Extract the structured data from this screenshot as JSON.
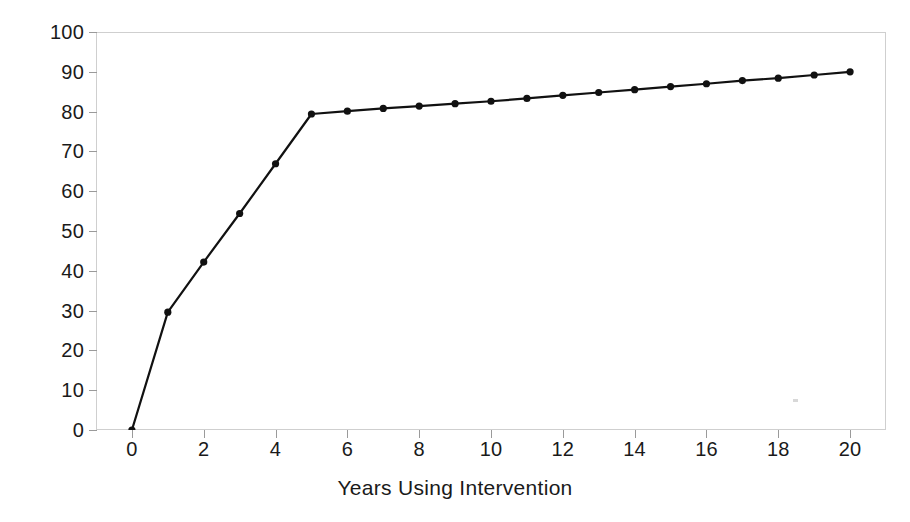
{
  "chart_data": {
    "type": "line",
    "title": "",
    "xlabel": "Years Using Intervention",
    "ylabel": "Percent Mortality Averted",
    "xlim": [
      -1,
      21
    ],
    "ylim": [
      0,
      100
    ],
    "grid": false,
    "legend": false,
    "line_color": "#111111",
    "marker": "circle",
    "marker_color": "#111111",
    "x": [
      0,
      1,
      2,
      3,
      4,
      5,
      6,
      7,
      8,
      9,
      10,
      11,
      12,
      13,
      14,
      15,
      16,
      17,
      18,
      19,
      20
    ],
    "values": [
      0,
      29.6,
      42.2,
      54.4,
      66.9,
      79.4,
      80.1,
      80.8,
      81.4,
      82.0,
      82.6,
      83.3,
      84.1,
      84.8,
      85.5,
      86.3,
      87.0,
      87.8,
      88.4,
      89.2,
      90.0
    ],
    "x_ticks": [
      0,
      2,
      4,
      6,
      8,
      10,
      12,
      14,
      16,
      18,
      20
    ],
    "x_tick_labels": [
      "0",
      "2",
      "4",
      "6",
      "8",
      "10",
      "12",
      "14",
      "16",
      "18",
      "20"
    ],
    "y_ticks": [
      0,
      10,
      20,
      30,
      40,
      50,
      60,
      70,
      80,
      90,
      100
    ],
    "y_tick_labels": [
      "0",
      "10",
      "20",
      "30",
      "40",
      "50",
      "60",
      "70",
      "80",
      "90",
      "100"
    ]
  },
  "figure": {
    "background_color": "#ffffff",
    "frame_color": "#cfcfcf"
  }
}
